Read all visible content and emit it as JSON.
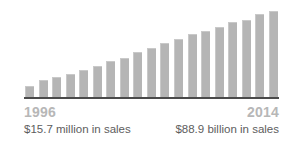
{
  "chart_data": {
    "type": "bar",
    "title": "",
    "subtitle": "",
    "xlabel": "",
    "ylabel": "",
    "grid": false,
    "legend": "none",
    "bar_color": "#b5b5b5",
    "axis_color": "#4a4a4a",
    "ylim": [
      0,
      100
    ],
    "categories": [
      "1996",
      "1997",
      "1998",
      "1999",
      "2000",
      "2001",
      "2002",
      "2003",
      "2004",
      "2005",
      "2006",
      "2007",
      "2008",
      "2009",
      "2010",
      "2011",
      "2012",
      "2013",
      "2014"
    ],
    "values": [
      13,
      20,
      23,
      27,
      31,
      36,
      41,
      45,
      51,
      56,
      61,
      66,
      71,
      74,
      79,
      84,
      87,
      93,
      97
    ],
    "annotations": [
      {
        "label": "1996",
        "value": "$15.7 million in sales",
        "position": "left"
      },
      {
        "label": "2014",
        "value": "$88.9 billion in sales",
        "position": "right"
      }
    ]
  },
  "captions": {
    "left": {
      "year": "1996",
      "sales": "$15.7 million in sales"
    },
    "right": {
      "year": "2014",
      "sales": "$88.9 billion in sales"
    }
  },
  "colors": {
    "bar": "#b5b5b5",
    "bar_edge": "#c9c9c9",
    "baseline": "#4a4a4a",
    "year_text": "#b7b7b7",
    "sales_text": "#5d5d5d",
    "background": "#ffffff"
  }
}
